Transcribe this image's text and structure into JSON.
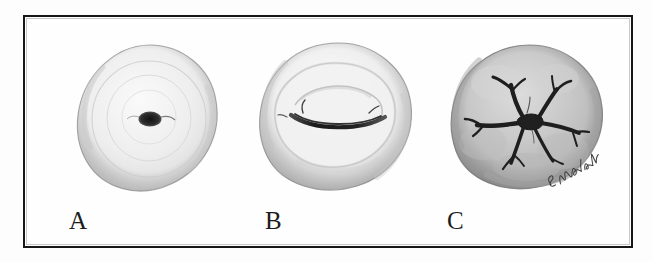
{
  "figure": {
    "type": "medical-illustration",
    "caption_absent": true,
    "frame": {
      "border_color": "#171717",
      "background": "#fefefe"
    },
    "background_color": "#ffffff"
  },
  "panels": [
    {
      "label": "A",
      "name": "panel-a",
      "subject": "cervix",
      "os_shape": "round",
      "os_description": "small round central opening",
      "body_fill": "#ececec",
      "rim_fill": "#dcdcdc",
      "os_color": "#2a2a2a"
    },
    {
      "label": "B",
      "name": "panel-b",
      "subject": "cervix",
      "os_shape": "transverse-slit",
      "os_description": "horizontal curved slit opening",
      "body_fill": "#e4e4e4",
      "rim_fill": "#d2d2d2",
      "os_color": "#262626"
    },
    {
      "label": "C",
      "name": "panel-c",
      "subject": "cervix",
      "os_shape": "stellate",
      "os_description": "irregular stellate opening with branching lacerations",
      "body_fill": "#c4c4c4",
      "rim_fill": "#b0b0b0",
      "os_color": "#1f1f1f"
    }
  ],
  "signature": {
    "name": "artist-signature",
    "text": "E. Walsh",
    "ink_color": "#3a3a3a"
  }
}
